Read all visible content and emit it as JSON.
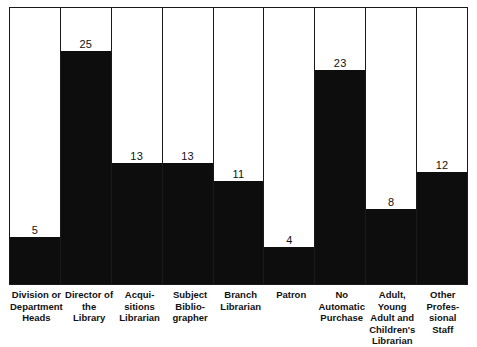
{
  "chart_data": {
    "type": "bar",
    "title": "",
    "subtitle": "",
    "xlabel": "",
    "ylabel": "",
    "ylim": [
      0,
      29.6
    ],
    "grid": false,
    "legend": null,
    "orientation": "vertical",
    "bar_color": "#0d0d0d",
    "frame_color": "#1a1a1a",
    "background": "#ffffff",
    "value_label_position": "above-bar-inside-column",
    "categories": [
      "Division or\nDepartment\nHeads",
      "Director of\nthe Library",
      "Acqui-\nsitions\nLibrarian",
      "Subject\nBiblio-\ngrapher",
      "Branch\nLibrarian",
      "Patron",
      "No\nAutomatic\nPurchase",
      "Adult, Young\nAdult and\nChildren's\nLibrarian",
      "Other\nProfes-\nsional Staff"
    ],
    "values": [
      5,
      25,
      13,
      13,
      11,
      4,
      23,
      8,
      12
    ],
    "value_labels": [
      "5",
      "25",
      "13",
      "13",
      "11",
      "4",
      "23",
      "8",
      "12"
    ]
  },
  "bars": [
    {
      "label": "Division or\nDepartment\nHeads",
      "value": 5,
      "value_label": "5"
    },
    {
      "label": "Director of\nthe Library",
      "value": 25,
      "value_label": "25"
    },
    {
      "label": "Acqui-\nsitions\nLibrarian",
      "value": 13,
      "value_label": "13"
    },
    {
      "label": "Subject\nBiblio-\ngrapher",
      "value": 13,
      "value_label": "13"
    },
    {
      "label": "Branch\nLibrarian",
      "value": 11,
      "value_label": "11"
    },
    {
      "label": "Patron",
      "value": 4,
      "value_label": "4"
    },
    {
      "label": "No\nAutomatic\nPurchase",
      "value": 23,
      "value_label": "23"
    },
    {
      "label": "Adult, Young\nAdult and\nChildren's\nLibrarian",
      "value": 8,
      "value_label": "8"
    },
    {
      "label": "Other\nProfes-\nsional Staff",
      "value": 12,
      "value_label": "12"
    }
  ]
}
